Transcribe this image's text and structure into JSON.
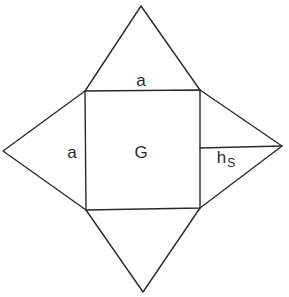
{
  "diagram": {
    "stroke_color": "#2a2a2a",
    "background": "#ffffff",
    "square": {
      "name": "base",
      "label": "G",
      "corners": {
        "top_left": [
          85,
          91
        ],
        "top_right": [
          200,
          90
        ],
        "bottom_right": [
          200,
          208
        ],
        "bottom_left": [
          86,
          210
        ]
      }
    },
    "triangles": [
      {
        "name": "top-face",
        "apex": [
          141,
          6
        ],
        "base": [
          "top_left",
          "top_right"
        ]
      },
      {
        "name": "left-face",
        "apex": [
          3,
          151
        ],
        "base": [
          "top_left",
          "bottom_left"
        ]
      },
      {
        "name": "right-face",
        "apex": [
          282,
          146
        ],
        "base": [
          "top_right",
          "bottom_right"
        ]
      },
      {
        "name": "bottom-face",
        "apex": [
          143,
          292
        ],
        "base": [
          "bottom_left",
          "bottom_right"
        ]
      }
    ],
    "height_line": {
      "from": [
        200,
        148
      ],
      "to": [
        282,
        146
      ]
    },
    "labels": {
      "top_side": "a",
      "left_side": "a",
      "base": "G",
      "side_height_main": "h",
      "side_height_sub": "S"
    }
  }
}
